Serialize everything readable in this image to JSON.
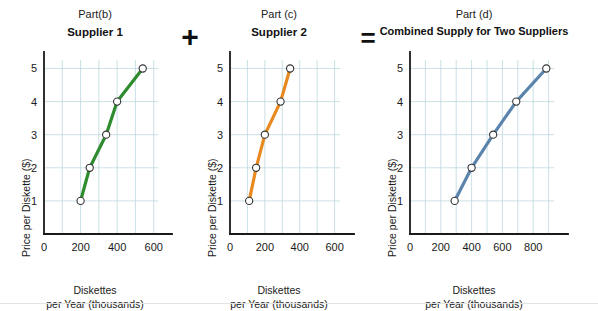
{
  "figure": {
    "operators": {
      "plus": "+",
      "equals": "="
    }
  },
  "panels": [
    {
      "part_label": "Part(b)",
      "title": "Supplier 1",
      "xlabel_line1": "Diskettes",
      "xlabel_line2": "per Year (thousands)",
      "ylabel": "Price per Diskette ($)",
      "xticks": [
        "0",
        "200",
        "400",
        "600"
      ],
      "yticks": [
        "1",
        "2",
        "3",
        "4",
        "5"
      ],
      "color": "#2e8b2e"
    },
    {
      "part_label": "Part (c)",
      "title": "Supplier 2",
      "xlabel_line1": "Diskettes",
      "xlabel_line2": "per Year (thousands)",
      "ylabel": "Price per Diskette ($)",
      "xticks": [
        "0",
        "200",
        "400",
        "600"
      ],
      "yticks": [
        "1",
        "2",
        "3",
        "4",
        "5"
      ],
      "color": "#e8891f"
    },
    {
      "part_label": "Part (d)",
      "title": "Combined Supply for Two Suppliers",
      "xlabel_line1": "Diskettes",
      "xlabel_line2": "per Year (thousands)",
      "ylabel": "Price per Diskette ($)",
      "xticks": [
        "0",
        "200",
        "400",
        "600",
        "800"
      ],
      "yticks": [
        "1",
        "2",
        "3",
        "4",
        "5"
      ],
      "color": "#5b84ad"
    }
  ],
  "chart_data": [
    {
      "type": "line",
      "title": "Supplier 1",
      "subtitle": "Part(b)",
      "xlabel": "Diskettes per Year (thousands)",
      "ylabel": "Price per Diskette ($)",
      "series": [
        {
          "name": "Supplier 1 supply",
          "color": "#2e8b2e",
          "marker": "open-circle",
          "x": [
            200,
            250,
            340,
            400,
            540
          ],
          "y": [
            1,
            2,
            3,
            4,
            5
          ]
        }
      ],
      "xlim": [
        0,
        700
      ],
      "ylim": [
        0,
        5.8
      ],
      "xticks": [
        0,
        200,
        400,
        600
      ],
      "yticks": [
        1,
        2,
        3,
        4,
        5
      ],
      "grid": true,
      "legend": "none"
    },
    {
      "type": "line",
      "title": "Supplier 2",
      "subtitle": "Part (c)",
      "xlabel": "Diskettes per Year (thousands)",
      "ylabel": "Price per Diskette ($)",
      "series": [
        {
          "name": "Supplier 2 supply",
          "color": "#e8891f",
          "marker": "open-circle",
          "x": [
            110,
            150,
            200,
            290,
            345
          ],
          "y": [
            1,
            2,
            3,
            4,
            5
          ]
        }
      ],
      "xlim": [
        0,
        700
      ],
      "ylim": [
        0,
        5.8
      ],
      "xticks": [
        0,
        200,
        400,
        600
      ],
      "yticks": [
        1,
        2,
        3,
        4,
        5
      ],
      "grid": true,
      "legend": "none"
    },
    {
      "type": "line",
      "title": "Combined Supply for Two Suppliers",
      "subtitle": "Part (d)",
      "xlabel": "Diskettes per Year (thousands)",
      "ylabel": "Price per Diskette ($)",
      "series": [
        {
          "name": "Combined supply",
          "color": "#5b84ad",
          "marker": "open-circle",
          "x": [
            290,
            400,
            540,
            690,
            885
          ],
          "y": [
            1,
            2,
            3,
            4,
            5
          ]
        }
      ],
      "xlim": [
        0,
        1000
      ],
      "ylim": [
        0,
        5.8
      ],
      "xticks": [
        0,
        200,
        400,
        600,
        800
      ],
      "yticks": [
        1,
        2,
        3,
        4,
        5
      ],
      "grid": true,
      "legend": "none"
    }
  ]
}
